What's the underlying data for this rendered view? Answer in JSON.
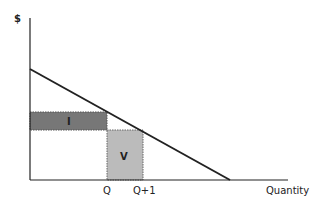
{
  "diagram": {
    "y_axis_label": "$",
    "x_axis_label": "Quantity",
    "tick_labels": {
      "q": "Q",
      "q_plus_1": "Q+1"
    },
    "regions": {
      "loss_area": {
        "label": "I",
        "color": "#777777"
      },
      "gain_area": {
        "label": "V",
        "color": "#bbbbbb"
      }
    },
    "demand_line": {
      "color": "#222222"
    }
  }
}
